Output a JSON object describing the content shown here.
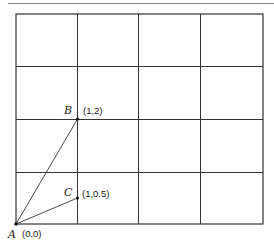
{
  "diagram": {
    "type": "coordinate-grid",
    "grid": {
      "columns": 4,
      "rows": 4
    },
    "points": [
      {
        "name": "A",
        "coord_label": "(0,0)",
        "x": 0,
        "y": 0
      },
      {
        "name": "B",
        "coord_label": "(1,2)",
        "x": 1,
        "y": 2
      },
      {
        "name": "C",
        "coord_label": "(1,0.5)",
        "x": 1,
        "y": 0.5
      }
    ],
    "segments": [
      {
        "from": "A",
        "to": "B"
      },
      {
        "from": "A",
        "to": "C"
      }
    ],
    "colors": {
      "grid": "#333333",
      "line": "#333333",
      "frame": "#888888"
    }
  }
}
